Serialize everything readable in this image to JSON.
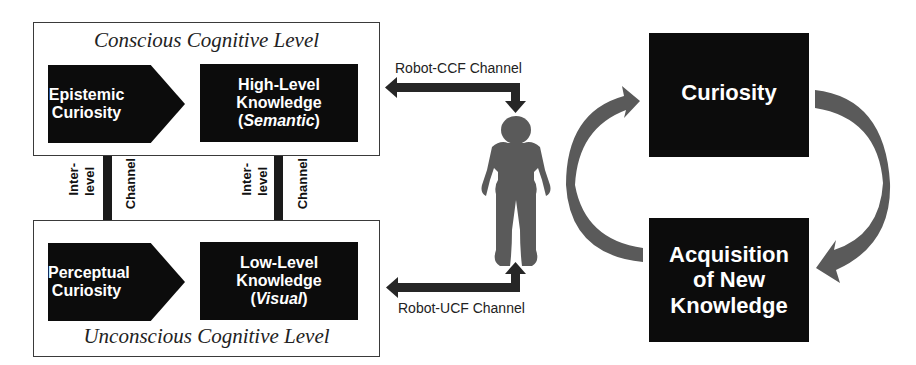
{
  "conscious_level": {
    "title": "Conscious Cognitive Level",
    "curiosity_box": {
      "line1": "Epistemic",
      "line2": "Curiosity"
    },
    "knowledge_box": {
      "line1": "High-Level",
      "line2": "Knowledge",
      "type": "Semantic"
    }
  },
  "unconscious_level": {
    "title": "Unconscious Cognitive Level",
    "curiosity_box": {
      "line1": "Perceptual",
      "line2": "Curiosity"
    },
    "knowledge_box": {
      "line1": "Low-Level",
      "line2": "Knowledge",
      "type": "Visual"
    }
  },
  "inter_level_channels": [
    {
      "label_a": "Inter-",
      "label_b": "level",
      "label_c": "Channel"
    },
    {
      "label_a": "Inter-",
      "label_b": "level",
      "label_c": "Channel"
    }
  ],
  "robot_channels": {
    "ccf": "Robot-CCF Channel",
    "ucf": "Robot-UCF Channel"
  },
  "robot": {
    "icon": "robot-silhouette-icon"
  },
  "cycle": {
    "top": "Curiosity",
    "bottom": {
      "line1": "Acquisition",
      "line2": "of New",
      "line3": "Knowledge"
    }
  },
  "colors": {
    "box_fill": "#0c0c0c",
    "arrow_dark": "#222222",
    "arrow_gray": "#595959",
    "robot_gray": "#5a5a5a",
    "border": "#3a3a3a"
  }
}
